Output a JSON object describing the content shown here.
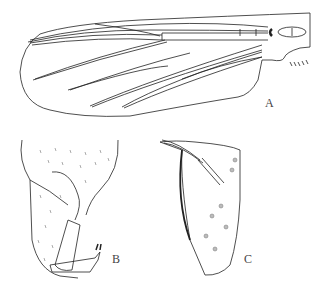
{
  "figure": {
    "panels": [
      {
        "id": "A",
        "label": "A",
        "subject": "wing"
      },
      {
        "id": "B",
        "label": "B",
        "subject": "hypopygium / gonocoxite and gonostylus"
      },
      {
        "id": "C",
        "label": "C",
        "subject": "appendage / volsella"
      }
    ],
    "colors": {
      "line": "#222222",
      "background": "#ffffff",
      "stipple": "#555555"
    }
  }
}
